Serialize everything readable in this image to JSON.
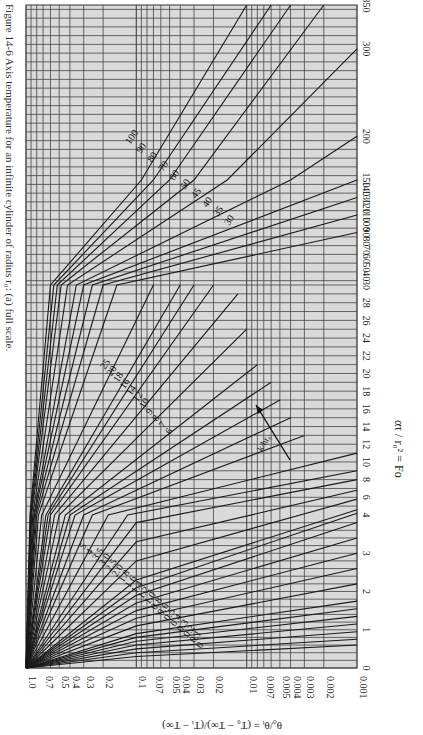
{
  "figure": {
    "caption": "Figure 14-6 Axis temperature for an infinite cylinder of radius r₀: (a) full scale."
  },
  "chart_data": {
    "type": "line",
    "orientation": "rotated 90 degrees (Fo axis vertical on right, theta axis horizontal on bottom)",
    "xlabel": "ατ / r₀² = Fo",
    "ylabel": "θ₀/θᵢ = (T₀ − T∞)/(Tᵢ − T∞)",
    "x_ticks": [
      "0",
      "1",
      "2",
      "3",
      "4",
      "6",
      "8",
      "10",
      "12",
      "14",
      "16",
      "18",
      "20",
      "22",
      "24",
      "26",
      "28",
      "30",
      "40",
      "50",
      "60",
      "70",
      "80",
      "90",
      "100",
      "110",
      "120",
      "130",
      "140",
      "150",
      "200",
      "300",
      "350"
    ],
    "y_ticks": [
      "1.0",
      "0.7",
      "0.5",
      "0.4",
      "0.3",
      "0.2",
      "0.1",
      "0.07",
      "0.05",
      "0.04",
      "0.03",
      "0.02",
      "0.01",
      "0.007",
      "0.005",
      "0.004",
      "0.003",
      "0.002",
      "0.001"
    ],
    "y_scale": "log",
    "ylim": [
      0.001,
      1.0
    ],
    "xlim": [
      0,
      350
    ],
    "grid": true,
    "parameter_label": "k/hr₀",
    "parameter_arrow_label": "k/hr₀",
    "curve_labels_group1": [
      "0",
      "0.1",
      "0.2",
      "0.3",
      "0.4",
      "0.5",
      "0.6",
      "0.8",
      "1.0",
      "1.2",
      "1.4",
      "1.6",
      "1.8",
      "2.0",
      "2.5",
      "3.0",
      "3.5",
      "4",
      "5"
    ],
    "curve_labels_group2": [
      "6",
      "7",
      "8",
      "9",
      "10",
      "12",
      "14",
      "16",
      "18",
      "20",
      "25"
    ],
    "curve_labels_group3": [
      "30",
      "35",
      "40",
      "45",
      "50",
      "60",
      "70",
      "80",
      "90",
      "100"
    ],
    "series": [
      {
        "name": "k/hr0=0",
        "x": [
          0,
          0.3,
          0.6
        ],
        "y": [
          1.0,
          0.1,
          0.001
        ]
      },
      {
        "name": "k/hr0=0.1",
        "x": [
          0,
          0.4,
          0.75
        ],
        "y": [
          1.0,
          0.1,
          0.001
        ]
      },
      {
        "name": "k/hr0=0.2",
        "x": [
          0,
          0.5,
          0.95
        ],
        "y": [
          1.0,
          0.1,
          0.001
        ]
      },
      {
        "name": "k/hr0=0.3",
        "x": [
          0,
          0.6,
          1.15
        ],
        "y": [
          1.0,
          0.1,
          0.001
        ]
      },
      {
        "name": "k/hr0=0.4",
        "x": [
          0,
          0.7,
          1.35
        ],
        "y": [
          1.0,
          0.1,
          0.001
        ]
      },
      {
        "name": "k/hr0=0.5",
        "x": [
          0,
          0.8,
          1.55
        ],
        "y": [
          1.0,
          0.1,
          0.001
        ]
      },
      {
        "name": "k/hr0=0.6",
        "x": [
          0,
          0.9,
          1.75
        ],
        "y": [
          1.0,
          0.1,
          0.001
        ]
      },
      {
        "name": "k/hr0=0.8",
        "x": [
          0,
          1.1,
          2.2
        ],
        "y": [
          1.0,
          0.1,
          0.001
        ]
      },
      {
        "name": "k/hr0=1.0",
        "x": [
          0,
          1.3,
          2.6
        ],
        "y": [
          1.0,
          0.1,
          0.001
        ]
      },
      {
        "name": "k/hr0=1.2",
        "x": [
          0,
          1.5,
          3.0
        ],
        "y": [
          1.0,
          0.1,
          0.001
        ]
      },
      {
        "name": "k/hr0=1.4",
        "x": [
          0,
          1.7,
          3.4
        ],
        "y": [
          1.0,
          0.1,
          0.001
        ]
      },
      {
        "name": "k/hr0=1.6",
        "x": [
          0,
          1.9,
          3.8
        ],
        "y": [
          1.0,
          0.1,
          0.001
        ]
      },
      {
        "name": "k/hr0=1.8",
        "x": [
          0,
          2.1,
          4.2
        ],
        "y": [
          1.0,
          0.1,
          0.001
        ]
      },
      {
        "name": "k/hr0=2.0",
        "x": [
          0,
          2.3,
          4.6
        ],
        "y": [
          1.0,
          0.1,
          0.001
        ]
      },
      {
        "name": "k/hr0=2.5",
        "x": [
          0,
          2.8,
          5.8
        ],
        "y": [
          1.0,
          0.1,
          0.001
        ]
      },
      {
        "name": "k/hr0=3.0",
        "x": [
          0,
          3.3,
          6.8
        ],
        "y": [
          1.0,
          0.1,
          0.001
        ]
      },
      {
        "name": "k/hr0=3.5",
        "x": [
          0,
          3.8,
          8.0
        ],
        "y": [
          1.0,
          0.1,
          0.001
        ]
      },
      {
        "name": "k/hr0=4",
        "x": [
          0,
          4,
          9
        ],
        "y": [
          1.0,
          0.12,
          0.001
        ]
      },
      {
        "name": "k/hr0=5",
        "x": [
          0,
          4,
          11
        ],
        "y": [
          1.0,
          0.18,
          0.001
        ]
      },
      {
        "name": "k/hr0=6",
        "x": [
          0,
          4,
          13
        ],
        "y": [
          1.0,
          0.25,
          0.003
        ]
      },
      {
        "name": "k/hr0=7",
        "x": [
          0,
          4,
          15
        ],
        "y": [
          1.0,
          0.3,
          0.004
        ]
      },
      {
        "name": "k/hr0=8",
        "x": [
          0,
          4,
          17
        ],
        "y": [
          1.0,
          0.36,
          0.005
        ]
      },
      {
        "name": "k/hr0=9",
        "x": [
          0,
          4,
          19
        ],
        "y": [
          1.0,
          0.4,
          0.006
        ]
      },
      {
        "name": "k/hr0=10",
        "x": [
          0,
          4,
          21
        ],
        "y": [
          1.0,
          0.44,
          0.008
        ]
      },
      {
        "name": "k/hr0=12",
        "x": [
          0,
          4,
          25
        ],
        "y": [
          1.0,
          0.5,
          0.01
        ]
      },
      {
        "name": "k/hr0=14",
        "x": [
          0,
          4,
          29
        ],
        "y": [
          1.0,
          0.55,
          0.012
        ]
      },
      {
        "name": "k/hr0=16",
        "x": [
          0,
          4,
          30
        ],
        "y": [
          1.0,
          0.6,
          0.02
        ]
      },
      {
        "name": "k/hr0=18",
        "x": [
          0,
          4,
          30
        ],
        "y": [
          1.0,
          0.63,
          0.03
        ]
      },
      {
        "name": "k/hr0=20",
        "x": [
          0,
          4,
          30
        ],
        "y": [
          1.0,
          0.66,
          0.04
        ]
      },
      {
        "name": "k/hr0=25",
        "x": [
          0,
          4,
          30
        ],
        "y": [
          1.0,
          0.72,
          0.07
        ]
      },
      {
        "name": "k/hr0=30",
        "x": [
          0,
          4,
          30,
          90
        ],
        "y": [
          1.0,
          0.77,
          0.15,
          0.001
        ]
      },
      {
        "name": "k/hr0=35",
        "x": [
          0,
          4,
          30,
          110
        ],
        "y": [
          1.0,
          0.8,
          0.2,
          0.001
        ]
      },
      {
        "name": "k/hr0=40",
        "x": [
          0,
          4,
          30,
          130
        ],
        "y": [
          1.0,
          0.82,
          0.25,
          0.001
        ]
      },
      {
        "name": "k/hr0=45",
        "x": [
          0,
          4,
          30,
          150
        ],
        "y": [
          1.0,
          0.84,
          0.3,
          0.001
        ]
      },
      {
        "name": "k/hr0=50",
        "x": [
          0,
          4,
          30,
          150,
          200
        ],
        "y": [
          1.0,
          0.85,
          0.35,
          0.004,
          0.001
        ]
      },
      {
        "name": "k/hr0=60",
        "x": [
          0,
          4,
          30,
          150,
          300
        ],
        "y": [
          1.0,
          0.87,
          0.42,
          0.015,
          0.001
        ]
      },
      {
        "name": "k/hr0=70",
        "x": [
          0,
          4,
          30,
          150,
          350
        ],
        "y": [
          1.0,
          0.89,
          0.48,
          0.03,
          0.002
        ]
      },
      {
        "name": "k/hr0=80",
        "x": [
          0,
          4,
          30,
          150,
          350
        ],
        "y": [
          1.0,
          0.9,
          0.52,
          0.05,
          0.004
        ]
      },
      {
        "name": "k/hr0=90",
        "x": [
          0,
          4,
          30,
          150,
          350
        ],
        "y": [
          1.0,
          0.91,
          0.56,
          0.07,
          0.006
        ]
      },
      {
        "name": "k/hr0=100",
        "x": [
          0,
          4,
          30,
          150,
          350
        ],
        "y": [
          1.0,
          0.92,
          0.6,
          0.09,
          0.01
        ]
      }
    ]
  }
}
